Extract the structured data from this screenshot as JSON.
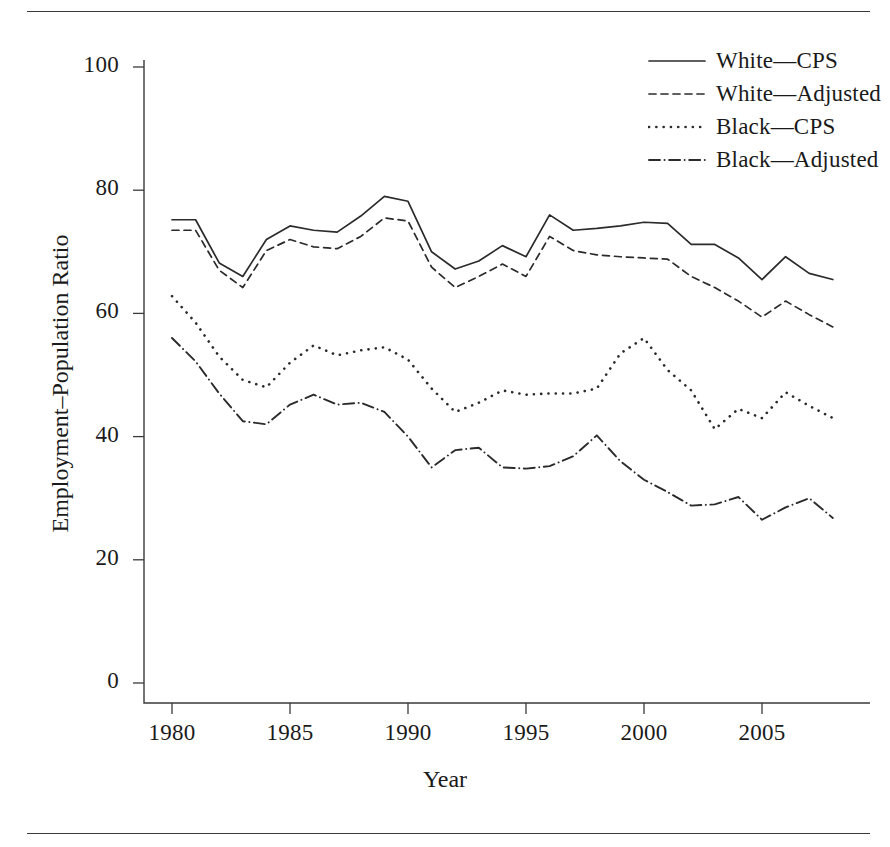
{
  "figure": {
    "background": "#ffffff",
    "ink_color": "#2b2b2b",
    "has_top_rule": true,
    "has_bottom_rule": true
  },
  "axis_title_x": "Year",
  "axis_title_y": "Employment–Population Ratio",
  "legend": {
    "position": "top-right",
    "entries": [
      {
        "label": "White—CPS",
        "style": "solid",
        "icon": "solid-line-swatch"
      },
      {
        "label": "White—Adjusted",
        "style": "dashed",
        "icon": "dashed-line-swatch"
      },
      {
        "label": "Black—CPS",
        "style": "dotted",
        "icon": "dotted-line-swatch"
      },
      {
        "label": "Black—Adjusted",
        "style": "dashdot",
        "icon": "dashdot-line-swatch"
      }
    ]
  },
  "ticks": {
    "y": [
      "0",
      "20",
      "40",
      "60",
      "80",
      "100"
    ],
    "x": [
      "1980",
      "1985",
      "1990",
      "1995",
      "2000",
      "2005"
    ]
  },
  "chart_data": {
    "type": "line",
    "title": "",
    "xlabel": "Year",
    "ylabel": "Employment–Population Ratio",
    "xlim": [
      1980,
      2008
    ],
    "ylim": [
      0,
      105
    ],
    "xticks": [
      1980,
      1985,
      1990,
      1995,
      2000,
      2005
    ],
    "yticks": [
      0,
      20,
      40,
      60,
      80,
      100
    ],
    "grid": false,
    "legend_position": "top-right",
    "x": [
      1980,
      1981,
      1982,
      1983,
      1984,
      1985,
      1986,
      1987,
      1988,
      1989,
      1990,
      1991,
      1992,
      1993,
      1994,
      1995,
      1996,
      1997,
      1998,
      1999,
      2000,
      2001,
      2002,
      2003,
      2004,
      2005,
      2006,
      2007,
      2008
    ],
    "series": [
      {
        "name": "White—CPS",
        "style": "solid",
        "values": [
          75.2,
          75.2,
          68.2,
          66.0,
          72.0,
          74.2,
          73.5,
          73.2,
          75.8,
          79.0,
          78.2,
          70.0,
          67.2,
          68.5,
          71.0,
          69.2,
          76.0,
          73.5,
          73.8,
          74.2,
          74.8,
          74.6,
          71.2,
          71.2,
          69.0,
          65.5,
          69.2,
          66.5,
          65.5
        ]
      },
      {
        "name": "White—Adjusted",
        "style": "dashed",
        "values": [
          73.5,
          73.5,
          67.0,
          64.2,
          70.2,
          72.0,
          70.8,
          70.5,
          72.5,
          75.5,
          75.0,
          67.5,
          64.2,
          66.0,
          68.0,
          66.0,
          72.5,
          70.2,
          69.5,
          69.2,
          69.0,
          68.8,
          66.0,
          64.2,
          62.0,
          59.4,
          62.0,
          59.8,
          57.8
        ]
      },
      {
        "name": "Black—CPS",
        "style": "dotted",
        "values": [
          62.8,
          58.5,
          53.0,
          49.2,
          48.0,
          52.0,
          54.8,
          53.2,
          54.0,
          54.5,
          52.5,
          47.8,
          44.0,
          45.5,
          47.5,
          46.8,
          47.0,
          47.0,
          47.8,
          53.5,
          56.0,
          50.8,
          47.5,
          41.2,
          44.5,
          43.0,
          47.2,
          45.0,
          43.0
        ]
      },
      {
        "name": "Black—Adjusted",
        "style": "dashdot",
        "values": [
          56.0,
          52.2,
          47.0,
          42.5,
          42.0,
          45.2,
          46.8,
          45.2,
          45.5,
          44.0,
          40.0,
          35.0,
          37.8,
          38.2,
          35.0,
          34.8,
          35.2,
          36.8,
          40.2,
          36.0,
          33.0,
          31.0,
          28.8,
          29.0,
          30.2,
          26.5,
          28.5,
          30.0,
          26.8
        ]
      }
    ]
  }
}
